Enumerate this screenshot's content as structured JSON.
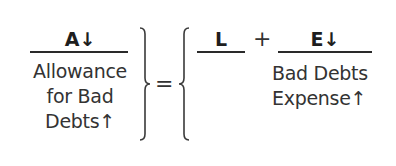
{
  "equation": {
    "left_side": {
      "header": "A↓",
      "account_lines": [
        "Allowance",
        "for Bad",
        "Debts↑"
      ]
    },
    "equals_sign": "=",
    "right_side": {
      "liabilities": {
        "header": "L",
        "account_lines": []
      },
      "plus_sign": "+",
      "equity": {
        "header": "E↓",
        "account_lines": [
          "Bad Debts",
          "Expense↑"
        ]
      }
    }
  },
  "colors": {
    "text": "#333333",
    "rule": "#2a2a2a",
    "background": "#ffffff"
  }
}
